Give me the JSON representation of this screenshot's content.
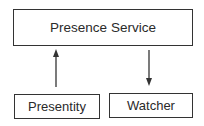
{
  "diagram": {
    "nodes": [
      {
        "id": "presence-service",
        "label": "Presence Service"
      },
      {
        "id": "presentity",
        "label": "Presentity"
      },
      {
        "id": "watcher",
        "label": "Watcher"
      }
    ],
    "edges": [
      {
        "from": "presentity",
        "to": "presence-service",
        "direction": "up"
      },
      {
        "from": "presence-service",
        "to": "watcher",
        "direction": "down"
      }
    ]
  }
}
